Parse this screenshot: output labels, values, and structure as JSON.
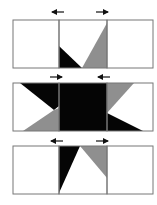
{
  "diagram": {
    "colors": {
      "background": "#ffffff",
      "border": "#777777",
      "dark": "#050505",
      "gray": "#8f8f8f",
      "arrow": "#111111"
    },
    "panels": [
      {
        "id": "top",
        "arrows": [
          {
            "direction": "left",
            "glyph": "←"
          },
          {
            "direction": "right",
            "glyph": "→"
          }
        ]
      },
      {
        "id": "middle",
        "arrows": [
          {
            "direction": "right",
            "glyph": "→"
          },
          {
            "direction": "left",
            "glyph": "←"
          }
        ]
      },
      {
        "id": "bottom",
        "arrows": [
          {
            "direction": "left",
            "glyph": "←"
          },
          {
            "direction": "right",
            "glyph": "→"
          }
        ]
      }
    ]
  }
}
